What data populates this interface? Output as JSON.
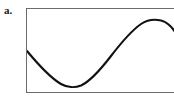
{
  "figure": {
    "part_label": "a.",
    "caption": "",
    "frame": {
      "border_color": "#6b6b6b",
      "background": "#ffffff",
      "left": 26,
      "top": 8,
      "width": 150,
      "height": 85
    }
  },
  "chart_data": {
    "type": "line",
    "title": "",
    "subtitle": "",
    "xlabel": "",
    "ylabel": "",
    "legend": [],
    "legend_position": "none",
    "grid": false,
    "axis_ticks": [],
    "xlim": [
      0,
      150
    ],
    "ylim": [
      85,
      0
    ],
    "series": [
      {
        "name": "sine-wave",
        "color": "#111111",
        "line_width": 2.1,
        "description": "One smooth sinusoidal cycle: begins at mid-left descending, reaches a trough left-of-center, rises through the middle, crests near the right, then descends to the right edge.",
        "x": [
          0,
          8,
          16,
          24,
          32,
          38,
          44,
          52,
          60,
          68,
          76,
          84,
          92,
          100,
          108,
          112,
          116,
          124,
          132,
          138,
          144,
          150
        ],
        "y": [
          42,
          51,
          60,
          68,
          74,
          77,
          78,
          77,
          73,
          66,
          57,
          47,
          37,
          28,
          20,
          17,
          14,
          11,
          11,
          12,
          17,
          26
        ],
        "key_points": [
          {
            "label": "left-edge-start",
            "x": 0,
            "y": 42
          },
          {
            "label": "trough",
            "x": 44,
            "y": 78
          },
          {
            "label": "mid-rise",
            "x": 88,
            "y": 42
          },
          {
            "label": "peak",
            "x": 130,
            "y": 11
          },
          {
            "label": "right-edge-end",
            "x": 150,
            "y": 26
          }
        ],
        "path": "M 0,42 C 10,54 22,68 34,75 C 40,78.5 48,79 54,76.5 C 64,72 74,60 84,47 C 94,34 104,22 114,15 C 120,11 128,10 134,11.5 C 140,13 146,19 150,26"
      }
    ]
  }
}
